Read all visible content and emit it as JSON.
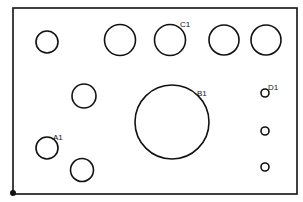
{
  "diagram": {
    "type": "hole-pattern-plate",
    "colors": {
      "stroke": "#111111",
      "background": "#ffffff"
    },
    "plate": {
      "x": 13,
      "y": 8,
      "width": 284,
      "height": 186
    },
    "origin": {
      "x": 13,
      "y": 193,
      "r": 3
    },
    "holes": [
      {
        "id": "h1",
        "cx": 47,
        "cy": 42,
        "r": 11,
        "label": ""
      },
      {
        "id": "h2",
        "cx": 120,
        "cy": 40,
        "r": 15.5,
        "label": ""
      },
      {
        "id": "h3",
        "cx": 170,
        "cy": 40,
        "r": 15.5,
        "label": "C1"
      },
      {
        "id": "h4",
        "cx": 224,
        "cy": 40,
        "r": 15,
        "label": ""
      },
      {
        "id": "h5",
        "cx": 266,
        "cy": 40,
        "r": 15,
        "label": ""
      },
      {
        "id": "h6",
        "cx": 84,
        "cy": 96,
        "r": 12,
        "label": ""
      },
      {
        "id": "h7",
        "cx": 172,
        "cy": 122,
        "r": 37,
        "label": "B1"
      },
      {
        "id": "h8",
        "cx": 265,
        "cy": 93,
        "r": 4,
        "label": "D1"
      },
      {
        "id": "h9",
        "cx": 265,
        "cy": 131,
        "r": 4,
        "label": ""
      },
      {
        "id": "h10",
        "cx": 265,
        "cy": 167,
        "r": 4,
        "label": ""
      },
      {
        "id": "h11",
        "cx": 47,
        "cy": 148,
        "r": 11,
        "label": "A1"
      },
      {
        "id": "h12",
        "cx": 82,
        "cy": 170,
        "r": 11.5,
        "label": ""
      }
    ],
    "labels": [
      {
        "text": "C1",
        "x": 180,
        "y": 27
      },
      {
        "text": "B1",
        "x": 197,
        "y": 96
      },
      {
        "text": "D1",
        "x": 268,
        "y": 90
      },
      {
        "text": "A1",
        "x": 53,
        "y": 140
      }
    ]
  }
}
